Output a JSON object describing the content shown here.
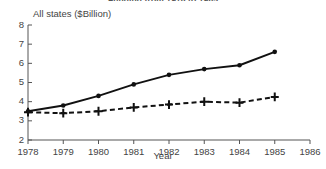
{
  "chart_data": {
    "type": "line",
    "title": "Funding from 1978 to 1985",
    "subtitle": "All states ($Billion)",
    "xlabel": "Year",
    "ylabel": "",
    "x": [
      1978,
      1979,
      1980,
      1981,
      1982,
      1983,
      1984,
      1985
    ],
    "xlim": [
      1978,
      1986
    ],
    "ylim": [
      2,
      8
    ],
    "xticks": [
      1978,
      1979,
      1980,
      1981,
      1982,
      1983,
      1984,
      1985,
      1986
    ],
    "xticklabels": [
      "1978",
      "1979",
      "1980",
      "1981",
      "1982",
      "1983",
      "1984",
      "1985",
      "1986"
    ],
    "yticks": [
      2,
      3,
      4,
      5,
      6,
      7,
      8
    ],
    "yticklabels": [
      "2",
      "3",
      "4",
      "5",
      "6",
      "7",
      "8"
    ],
    "grid": false,
    "legend": "none",
    "series": [
      {
        "name": "solid-series",
        "style": "solid",
        "marker": "circle",
        "color": "#111111",
        "values": [
          3.5,
          3.8,
          4.3,
          4.9,
          5.4,
          5.7,
          5.9,
          6.6
        ]
      },
      {
        "name": "dashed-series",
        "style": "dashed",
        "marker": "plus",
        "color": "#111111",
        "values": [
          3.45,
          3.4,
          3.5,
          3.7,
          3.85,
          4.0,
          3.95,
          4.25
        ]
      }
    ]
  },
  "colors": {
    "axis": "#555555",
    "text": "#444444",
    "line": "#111111",
    "background": "#ffffff"
  }
}
